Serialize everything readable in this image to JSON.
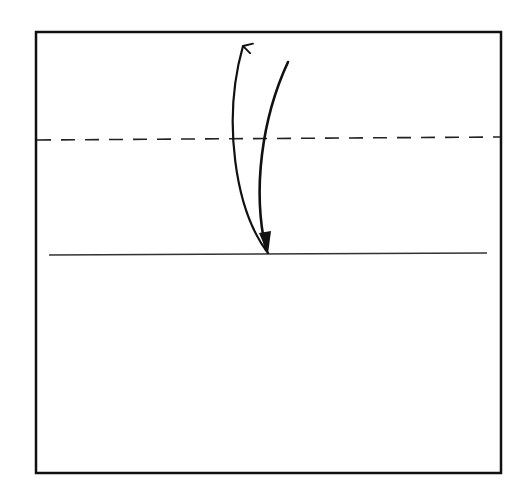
{
  "diagram": {
    "type": "origami-fold-step",
    "colors": {
      "background": "#ffffff",
      "stroke": "#111111"
    },
    "paper": {
      "x": 36,
      "y": 32,
      "width": 465,
      "height": 441,
      "stroke_width": 2.5
    },
    "fold_line_dashed": {
      "x1": 37,
      "y1": 140,
      "x2": 500,
      "y2": 137,
      "dash": "14 10",
      "stroke_width": 1.6
    },
    "crease_line_solid": {
      "x1": 49,
      "y1": 255,
      "x2": 487,
      "y2": 253,
      "stroke_width": 1.4
    },
    "arrows": [
      {
        "name": "fold-up-arrow",
        "path": "M 268 253 C 235 210, 222 120, 243 46",
        "head": "open",
        "head_at": "end"
      },
      {
        "name": "fold-down-arrow",
        "path": "M 288 62 C 262 118, 252 190, 266 250",
        "head": "filled",
        "head_at": "end"
      }
    ]
  }
}
